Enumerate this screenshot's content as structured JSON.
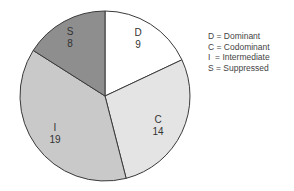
{
  "chart_data": {
    "type": "pie",
    "title": "",
    "categories": [
      "D",
      "C",
      "I",
      "S"
    ],
    "values": [
      9,
      14,
      19,
      8
    ],
    "total": 50,
    "start_angle_deg": -90,
    "direction": "clockwise",
    "colors": [
      "#ffffff",
      "#e4e4e4",
      "#c9c9c9",
      "#8e8e8e"
    ],
    "labels": [
      {
        "letter": "D",
        "value": "9"
      },
      {
        "letter": "C",
        "value": "14"
      },
      {
        "letter": "I",
        "value": "19"
      },
      {
        "letter": "S",
        "value": "8"
      }
    ],
    "legend": [
      {
        "key": "D",
        "text": "D = Dominant"
      },
      {
        "key": "C",
        "text": "C = Codominant"
      },
      {
        "key": "I",
        "text": "I  = Intermediate"
      },
      {
        "key": "S",
        "text": "S = Suppressed"
      }
    ],
    "legend_position": "right"
  }
}
